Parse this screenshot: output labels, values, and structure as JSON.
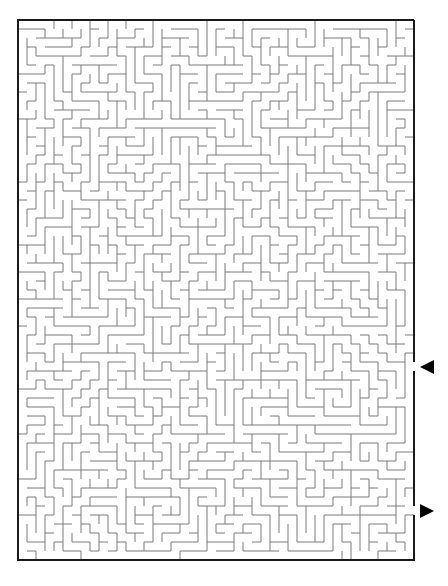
{
  "puzzle": {
    "type": "rectangular-maze",
    "cols": 44,
    "rows": 60,
    "cell_size_px": 9,
    "origin": [
      18,
      20
    ],
    "seed": 918273,
    "wall_color": "#7a7a7a",
    "border_color": "#1a1a1a"
  },
  "markers": {
    "entrance": {
      "icon": "arrow-left-icon",
      "side": "right",
      "row": 38,
      "color": "#000000"
    },
    "exit": {
      "icon": "arrow-right-icon",
      "side": "right",
      "row": 54,
      "color": "#000000"
    }
  }
}
